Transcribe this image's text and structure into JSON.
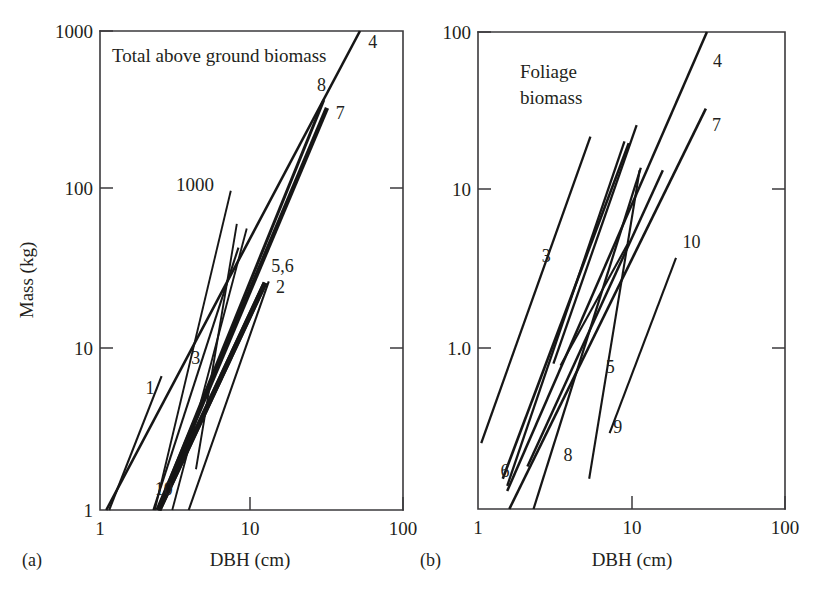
{
  "figure": {
    "title_visible": false,
    "background_color": "#ffffff",
    "line_color": "#161616",
    "axis_color": "#3b3a3c",
    "text_color": "#231f20"
  },
  "panels": [
    {
      "tag": "(a)",
      "note": "Total above ground biomass",
      "inner_annotation": "1000",
      "x_axis_title": "DBH (cm)",
      "y_axis_title": "Mass (kg)",
      "x_ticks": [
        "1",
        "10",
        "100"
      ],
      "y_ticks": [
        "1000",
        "100",
        "10",
        "1"
      ],
      "series_labels": [
        "4",
        "8",
        "7",
        "5,6",
        "2",
        "1",
        "3",
        "10"
      ]
    },
    {
      "tag": "(b)",
      "note_line1": "Foliage",
      "note_line2": "biomass",
      "x_axis_title": "DBH (cm)",
      "y_axis_title": "",
      "x_ticks": [
        "1",
        "10",
        "100"
      ],
      "y_ticks": [
        "100",
        "10",
        "1.0"
      ],
      "series_labels": [
        "4",
        "7",
        "3",
        "10",
        "5",
        "9",
        "8",
        "6"
      ]
    }
  ],
  "chart_data": [
    {
      "type": "line",
      "title": "Total above ground biomass",
      "panel": "(a)",
      "xlabel": "DBH (cm)",
      "ylabel": "Mass (kg)",
      "xscale": "log",
      "yscale": "log",
      "xlim": [
        1,
        100
      ],
      "ylim": [
        1,
        1000
      ],
      "xticks": [
        1,
        10,
        100
      ],
      "yticks": [
        1,
        10,
        100,
        1000
      ],
      "grid": false,
      "legend": "inline-endpoint-labels",
      "annotations": [
        {
          "text": "Total above ground biomass",
          "x": 1.35,
          "y": 700
        },
        {
          "text": "1000",
          "x": 3.0,
          "y": 105
        }
      ],
      "series": [
        {
          "name": "1",
          "x": [
            1.15,
            2.55
          ],
          "y": [
            1.0,
            6.9
          ],
          "label_x": 2.0,
          "label_y": 5.3,
          "width": 2.1
        },
        {
          "name": "2",
          "x": [
            3.85,
            13.0
          ],
          "y": [
            1.0,
            27.0
          ],
          "label_x": 14.5,
          "label_y": 23.0,
          "width": 2.1
        },
        {
          "name": "3",
          "x": [
            2.25,
            8.2
          ],
          "y": [
            1.0,
            44.0
          ],
          "label_x": 4.0,
          "label_y": 8.2,
          "width": 2.1
        },
        {
          "name": "4",
          "x": [
            1.1,
            52.0
          ],
          "y": [
            1.0,
            1000.0
          ],
          "label_x": 59.0,
          "label_y": 780.0,
          "width": 2.6
        },
        {
          "name": "5",
          "x": [
            2.45,
            12.3
          ],
          "y": [
            1.0,
            26.5
          ],
          "label_x": 13.5,
          "label_y": 31.0,
          "width": 5.0
        },
        {
          "name": "6",
          "x": [
            2.45,
            12.3
          ],
          "y": [
            1.0,
            26.5
          ],
          "label_x": 13.5,
          "label_y": 31.0,
          "width": 5.0
        },
        {
          "name": "7",
          "x": [
            2.4,
            31.5
          ],
          "y": [
            1.0,
            330.0
          ],
          "label_x": 36.0,
          "label_y": 280.0,
          "width": 4.4
        },
        {
          "name": "8",
          "x": [
            2.4,
            30.0
          ],
          "y": [
            1.0,
            370.0
          ],
          "label_x": 27.0,
          "label_y": 420.0,
          "width": 3.0
        },
        {
          "name": "10",
          "x": [
            2.3,
            7.3
          ],
          "y": [
            1.0,
            100.0
          ],
          "label_x": 2.3,
          "label_y": 1.25,
          "width": 1.9
        },
        {
          "name": "unlabeled-a1",
          "x": [
            4.3,
            8.0
          ],
          "y": [
            1.8,
            62.0
          ],
          "width": 1.9
        },
        {
          "name": "unlabeled-a2",
          "x": [
            3.0,
            9.3
          ],
          "y": [
            1.0,
            58.0
          ],
          "width": 1.9
        }
      ]
    },
    {
      "type": "line",
      "title": "Foliage biomass",
      "panel": "(b)",
      "xlabel": "DBH (cm)",
      "ylabel": "",
      "xscale": "log",
      "yscale": "log",
      "xlim": [
        1,
        100
      ],
      "ylim": [
        0.1,
        100
      ],
      "xticks": [
        1,
        10,
        100
      ],
      "yticks": [
        1.0,
        10,
        100
      ],
      "grid": false,
      "legend": "inline-endpoint-labels",
      "annotations": [
        {
          "text": "Foliage",
          "x": 1.9,
          "y": 46
        },
        {
          "text": "biomass",
          "x": 1.9,
          "y": 33
        }
      ],
      "series": [
        {
          "name": "3",
          "x": [
            3.1,
            10.8
          ],
          "y": [
            0.82,
            26.0
          ],
          "label_x": 2.6,
          "label_y": 3.6,
          "width": 2.3
        },
        {
          "name": "4",
          "x": [
            1.55,
            31.0
          ],
          "y": [
            0.13,
            100.0
          ],
          "label_x": 34.0,
          "label_y": 60.0,
          "width": 2.5
        },
        {
          "name": "5",
          "x": [
            2.1,
            16.0
          ],
          "y": [
            0.185,
            13.5
          ],
          "label_x": 6.8,
          "label_y": 0.72,
          "width": 2.5
        },
        {
          "name": "6",
          "x": [
            1.45,
            9.6
          ],
          "y": [
            0.155,
            20.0
          ],
          "label_x": 1.4,
          "label_y": 0.16,
          "width": 2.6
        },
        {
          "name": "7",
          "x": [
            1.6,
            30.5
          ],
          "y": [
            0.1,
            33.0
          ],
          "label_x": 33.5,
          "label_y": 24.0,
          "width": 2.6
        },
        {
          "name": "8",
          "x": [
            2.3,
            11.5
          ],
          "y": [
            0.1,
            14.0
          ],
          "label_x": 3.6,
          "label_y": 0.2,
          "width": 2.3
        },
        {
          "name": "9",
          "x": [
            5.3,
            11.3
          ],
          "y": [
            0.155,
            13.5
          ],
          "label_x": 7.6,
          "label_y": 0.3,
          "width": 2.1
        },
        {
          "name": "10",
          "x": [
            7.2,
            19.5
          ],
          "y": [
            0.3,
            3.8
          ],
          "label_x": 21.5,
          "label_y": 4.4,
          "width": 2.1
        },
        {
          "name": "unlabeled-b1",
          "x": [
            1.05,
            5.4
          ],
          "y": [
            0.26,
            22.0
          ],
          "width": 2.3
        },
        {
          "name": "unlabeled-b2",
          "x": [
            3.45,
            9.4
          ],
          "y": [
            0.8,
            4.6
          ],
          "width": 2.1
        },
        {
          "name": "unlabeled-b3",
          "x": [
            1.55,
            9.0
          ],
          "y": [
            0.14,
            20.5
          ],
          "width": 2.3
        }
      ]
    }
  ]
}
